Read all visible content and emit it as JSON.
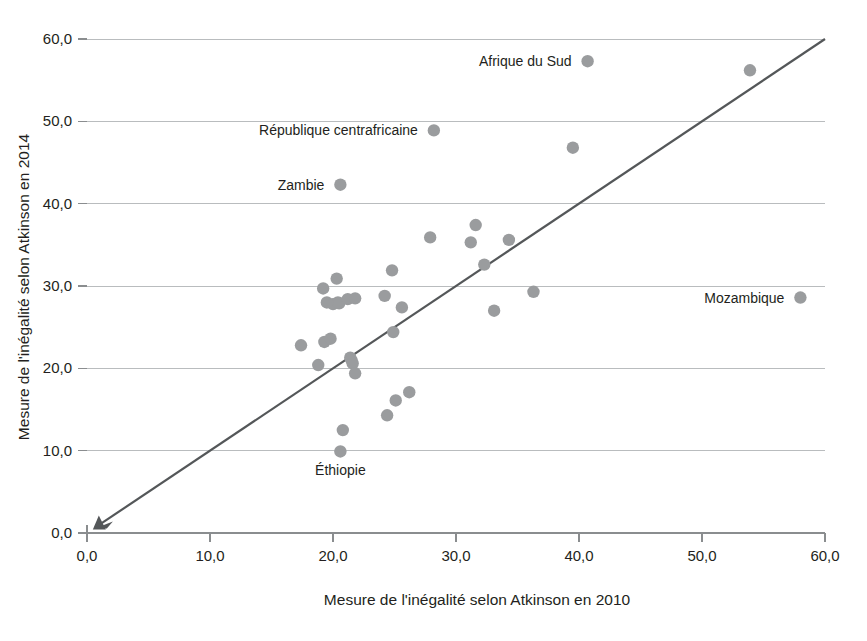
{
  "chart_data": {
    "type": "scatter",
    "title": "",
    "xlabel": "Mesure de l'inégalité selon Atkinson en 2010",
    "ylabel": "Mesure de l'inégalité selon Atkinson en 2014",
    "xlim": [
      0,
      60
    ],
    "ylim": [
      0,
      60
    ],
    "xticks": [
      "0,0",
      "10,0",
      "20,0",
      "30,0",
      "40,0",
      "50,0",
      "60,0"
    ],
    "xtick_values": [
      0,
      10,
      20,
      30,
      40,
      50,
      60
    ],
    "yticks": [
      "0,0",
      "10,0",
      "20,0",
      "30,0",
      "40,0",
      "50,0",
      "60,0"
    ],
    "ytick_values": [
      0,
      10,
      20,
      30,
      40,
      50,
      60
    ],
    "grid": "horizontal",
    "legend": "none",
    "series": [
      {
        "name": "Pays",
        "marker": "circle",
        "color": "#9a9c9e",
        "points": [
          {
            "x": 17.4,
            "y": 22.8,
            "label": ""
          },
          {
            "x": 18.8,
            "y": 20.4,
            "label": ""
          },
          {
            "x": 19.2,
            "y": 29.7,
            "label": ""
          },
          {
            "x": 19.3,
            "y": 23.2,
            "label": ""
          },
          {
            "x": 19.5,
            "y": 28.0,
            "label": ""
          },
          {
            "x": 19.8,
            "y": 23.6,
            "label": ""
          },
          {
            "x": 20.0,
            "y": 27.8,
            "label": ""
          },
          {
            "x": 20.3,
            "y": 30.9,
            "label": ""
          },
          {
            "x": 20.4,
            "y": 28.0,
            "label": ""
          },
          {
            "x": 20.5,
            "y": 27.9,
            "label": ""
          },
          {
            "x": 20.6,
            "y": 42.3,
            "label": "Zambie"
          },
          {
            "x": 20.6,
            "y": 9.9,
            "label": "Éthiopie"
          },
          {
            "x": 20.8,
            "y": 12.5,
            "label": ""
          },
          {
            "x": 21.2,
            "y": 28.4,
            "label": ""
          },
          {
            "x": 21.4,
            "y": 21.3,
            "label": ""
          },
          {
            "x": 21.5,
            "y": 21.0,
            "label": ""
          },
          {
            "x": 21.6,
            "y": 20.6,
            "label": ""
          },
          {
            "x": 21.8,
            "y": 28.5,
            "label": ""
          },
          {
            "x": 21.8,
            "y": 19.4,
            "label": ""
          },
          {
            "x": 24.2,
            "y": 28.8,
            "label": ""
          },
          {
            "x": 24.4,
            "y": 14.3,
            "label": ""
          },
          {
            "x": 24.8,
            "y": 31.9,
            "label": ""
          },
          {
            "x": 24.9,
            "y": 24.4,
            "label": ""
          },
          {
            "x": 25.1,
            "y": 16.1,
            "label": ""
          },
          {
            "x": 25.6,
            "y": 27.4,
            "label": ""
          },
          {
            "x": 26.2,
            "y": 17.1,
            "label": ""
          },
          {
            "x": 27.9,
            "y": 35.9,
            "label": ""
          },
          {
            "x": 28.2,
            "y": 48.9,
            "label": "République centrafricaine"
          },
          {
            "x": 31.2,
            "y": 35.3,
            "label": ""
          },
          {
            "x": 31.6,
            "y": 37.4,
            "label": ""
          },
          {
            "x": 32.3,
            "y": 32.6,
            "label": ""
          },
          {
            "x": 33.1,
            "y": 27.0,
            "label": ""
          },
          {
            "x": 34.3,
            "y": 35.6,
            "label": ""
          },
          {
            "x": 36.3,
            "y": 29.3,
            "label": ""
          },
          {
            "x": 39.5,
            "y": 46.8,
            "label": ""
          },
          {
            "x": 40.7,
            "y": 57.3,
            "label": "Afrique du Sud"
          },
          {
            "x": 53.9,
            "y": 56.2,
            "label": ""
          },
          {
            "x": 58.0,
            "y": 28.6,
            "label": "Mozambique"
          }
        ]
      }
    ],
    "reference_line": {
      "name": "ligne 45 degrés",
      "from": {
        "x": 0.8,
        "y": 0.8
      },
      "to": {
        "x": 60.0,
        "y": 60.0
      },
      "color": "#545759",
      "arrow_at": "start",
      "origin_marker": "triangle"
    },
    "annotations": [
      {
        "text": "Afrique du Sud",
        "x": 40.7,
        "y": 57.3,
        "placement": "left"
      },
      {
        "text": "République centrafricaine",
        "x": 28.2,
        "y": 48.9,
        "placement": "left"
      },
      {
        "text": "Zambie",
        "x": 20.6,
        "y": 42.3,
        "placement": "left"
      },
      {
        "text": "Mozambique",
        "x": 58.0,
        "y": 28.6,
        "placement": "left"
      },
      {
        "text": "Éthiopie",
        "x": 20.6,
        "y": 9.9,
        "placement": "below"
      }
    ]
  }
}
